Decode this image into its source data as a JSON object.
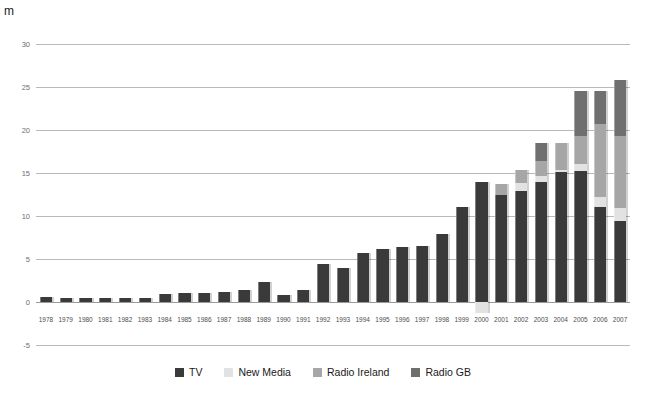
{
  "chart_data": {
    "type": "bar",
    "stacked": true,
    "title": "",
    "subtitle": "",
    "xlabel": "",
    "ylabel": "m",
    "unit_label": "m",
    "ylim": [
      -5,
      30
    ],
    "yticks": [
      30,
      25,
      20,
      15,
      10,
      5,
      0,
      -5
    ],
    "grid": true,
    "legend_position": "bottom",
    "categories": [
      "1978",
      "1979",
      "1980",
      "1981",
      "1982",
      "1983",
      "1984",
      "1985",
      "1986",
      "1987",
      "1988",
      "1989",
      "1990",
      "1991",
      "1992",
      "1993",
      "1994",
      "1995",
      "1996",
      "1997",
      "1998",
      "1999",
      "2000",
      "2001",
      "2002",
      "2003",
      "2004",
      "2005",
      "2006",
      "2007"
    ],
    "series": [
      {
        "name": "TV",
        "color": "#3a3a3a",
        "values": [
          0.6,
          0.5,
          0.5,
          0.5,
          0.5,
          0.5,
          0.9,
          1.0,
          1.0,
          1.2,
          1.4,
          2.3,
          0.8,
          1.4,
          4.4,
          3.9,
          5.7,
          6.2,
          6.4,
          6.5,
          7.9,
          11.1,
          14.0,
          12.4,
          12.9,
          13.9,
          15.1,
          15.2,
          11.1,
          9.4
        ]
      },
      {
        "name": "New Media",
        "color": "#e2e2e2",
        "values": [
          0,
          0,
          0,
          0,
          0,
          0,
          0,
          0,
          0,
          0,
          0,
          0,
          0,
          0,
          0,
          0,
          0,
          0,
          0,
          0,
          0,
          0,
          -1.3,
          0,
          0.9,
          0.8,
          0.3,
          0.9,
          1.1,
          1.5
        ]
      },
      {
        "name": "Radio Ireland",
        "color": "#a6a6a6",
        "values": [
          0,
          0,
          0,
          0,
          0,
          0,
          0,
          0,
          0,
          0,
          0,
          0,
          0,
          0,
          0,
          0,
          0,
          0,
          0,
          0,
          0,
          0,
          0,
          1.3,
          1.6,
          1.7,
          3.1,
          3.2,
          8.5,
          8.4
        ]
      },
      {
        "name": "Radio GB",
        "color": "#6f6f6f",
        "values": [
          0,
          0,
          0,
          0,
          0,
          0,
          0,
          0,
          0,
          0,
          0,
          0,
          0,
          0,
          0,
          0,
          0,
          0,
          0,
          0,
          0,
          0,
          0,
          0,
          0,
          2.1,
          0,
          5.2,
          3.8,
          6.5
        ]
      }
    ]
  },
  "legend": {
    "items": [
      {
        "label": "TV",
        "key": "tv",
        "color": "#3a3a3a"
      },
      {
        "label": "New Media",
        "key": "newmedia",
        "color": "#e2e2e2"
      },
      {
        "label": "Radio Ireland",
        "key": "radioireland",
        "color": "#a6a6a6"
      },
      {
        "label": "Radio GB",
        "key": "radiogb",
        "color": "#6f6f6f"
      }
    ]
  }
}
